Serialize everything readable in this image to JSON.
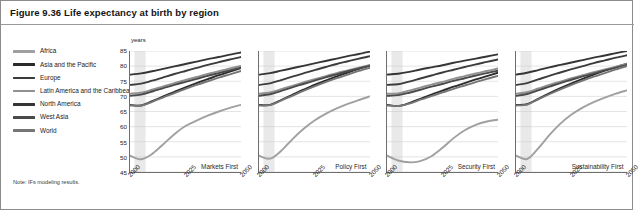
{
  "figure": {
    "title": "Figure 9.36 Life expectancy at birth by region",
    "note": "Note: IFs modeling results."
  },
  "legend": {
    "items": [
      {
        "label": "Africa",
        "color": "#a0a0a0"
      },
      {
        "label": "Asia and the Pacific",
        "color": "#2b2b2b"
      },
      {
        "label": "Europe",
        "color": "#3c3c3c"
      },
      {
        "label": "Latin America and the Caribbean",
        "color": "#909090"
      },
      {
        "label": "North America",
        "color": "#353535"
      },
      {
        "label": "West Asia",
        "color": "#4a4a4a"
      },
      {
        "label": "World",
        "color": "#767676"
      }
    ]
  },
  "axes": {
    "units": "years",
    "ylabels": [
      "85",
      "80",
      "75",
      "70",
      "65",
      "60",
      "55",
      "50",
      "45"
    ],
    "xlabels": [
      "2000",
      "2025",
      "2050"
    ]
  },
  "chart_data": {
    "type": "line",
    "title": "Life expectancy at birth by region",
    "xlabel": "",
    "ylabel": "years",
    "ylim": [
      45,
      85
    ],
    "xlim": [
      2000,
      2050
    ],
    "grid": true,
    "legend_position": "left",
    "x": [
      2000,
      2005,
      2010,
      2015,
      2020,
      2025,
      2030,
      2035,
      2040,
      2045,
      2050
    ],
    "panels": [
      {
        "name": "Markets First",
        "series": [
          {
            "name": "Africa",
            "color": "#a0a0a0",
            "values": [
              50.4,
              49.2,
              51.0,
              54.2,
              57.5,
              60.2,
              62.0,
              63.6,
              65.0,
              66.2,
              67.2
            ]
          },
          {
            "name": "Asia and the Pacific",
            "color": "#2b2b2b",
            "values": [
              67.2,
              67.0,
              68.4,
              70.0,
              71.5,
              73.0,
              74.4,
              75.7,
              77.0,
              78.2,
              79.4
            ]
          },
          {
            "name": "Europe",
            "color": "#3c3c3c",
            "values": [
              73.8,
              74.2,
              75.2,
              76.3,
              77.4,
              78.4,
              79.4,
              80.4,
              81.3,
              82.2,
              83.0
            ]
          },
          {
            "name": "Latin America and the Caribbean",
            "color": "#909090",
            "values": [
              70.9,
              71.2,
              72.2,
              73.3,
              74.4,
              75.4,
              76.4,
              77.4,
              78.3,
              79.2,
              80.1
            ]
          },
          {
            "name": "North America",
            "color": "#353535",
            "values": [
              77.2,
              77.6,
              78.3,
              79.1,
              79.9,
              80.7,
              81.5,
              82.3,
              83.0,
              83.8,
              84.5
            ]
          },
          {
            "name": "West Asia",
            "color": "#4a4a4a",
            "values": [
              70.2,
              70.6,
              71.6,
              72.7,
              73.8,
              74.8,
              75.8,
              76.8,
              77.7,
              78.6,
              79.5
            ]
          },
          {
            "name": "World",
            "color": "#767676",
            "values": [
              67.0,
              67.0,
              68.2,
              69.7,
              71.1,
              72.5,
              73.8,
              75.0,
              76.2,
              77.3,
              78.4
            ]
          }
        ]
      },
      {
        "name": "Policy First",
        "series": [
          {
            "name": "Africa",
            "color": "#a0a0a0",
            "values": [
              50.4,
              49.4,
              52.0,
              55.8,
              59.2,
              62.0,
              64.2,
              66.0,
              67.5,
              68.8,
              70.0
            ]
          },
          {
            "name": "Asia and the Pacific",
            "color": "#2b2b2b",
            "values": [
              67.2,
              67.2,
              68.8,
              70.5,
              72.2,
              73.8,
              75.2,
              76.6,
              77.9,
              79.1,
              80.2
            ]
          },
          {
            "name": "Europe",
            "color": "#3c3c3c",
            "values": [
              73.8,
              74.3,
              75.4,
              76.5,
              77.6,
              78.7,
              79.7,
              80.7,
              81.6,
              82.5,
              83.3
            ]
          },
          {
            "name": "Latin America and the Caribbean",
            "color": "#909090",
            "values": [
              70.9,
              71.3,
              72.4,
              73.5,
              74.6,
              75.7,
              76.7,
              77.7,
              78.6,
              79.5,
              80.4
            ]
          },
          {
            "name": "North America",
            "color": "#353535",
            "values": [
              77.2,
              77.7,
              78.5,
              79.3,
              80.1,
              80.9,
              81.7,
              82.5,
              83.3,
              84.0,
              84.8
            ]
          },
          {
            "name": "West Asia",
            "color": "#4a4a4a",
            "values": [
              70.2,
              70.7,
              71.8,
              73.0,
              74.1,
              75.2,
              76.3,
              77.3,
              78.3,
              79.2,
              80.1
            ]
          },
          {
            "name": "World",
            "color": "#767676",
            "values": [
              67.0,
              67.1,
              68.6,
              70.2,
              71.8,
              73.3,
              74.7,
              76.0,
              77.2,
              78.4,
              79.5
            ]
          }
        ]
      },
      {
        "name": "Security First",
        "series": [
          {
            "name": "Africa",
            "color": "#a0a0a0",
            "values": [
              50.4,
              48.8,
              48.2,
              48.6,
              50.2,
              53.0,
              56.2,
              58.8,
              60.6,
              61.7,
              62.3
            ]
          },
          {
            "name": "Asia and the Pacific",
            "color": "#2b2b2b",
            "values": [
              67.2,
              66.8,
              67.8,
              69.2,
              70.6,
              71.9,
              73.2,
              74.4,
              75.6,
              76.7,
              77.8
            ]
          },
          {
            "name": "Europe",
            "color": "#3c3c3c",
            "values": [
              73.8,
              74.0,
              74.9,
              75.9,
              76.9,
              77.9,
              78.8,
              79.7,
              80.6,
              81.4,
              82.2
            ]
          },
          {
            "name": "Latin America and the Caribbean",
            "color": "#909090",
            "values": [
              70.9,
              71.0,
              71.9,
              72.9,
              73.9,
              74.8,
              75.8,
              76.7,
              77.6,
              78.4,
              79.2
            ]
          },
          {
            "name": "North America",
            "color": "#353535",
            "values": [
              77.2,
              77.5,
              78.1,
              78.9,
              79.6,
              80.3,
              81.1,
              81.8,
              82.5,
              83.2,
              83.9
            ]
          },
          {
            "name": "West Asia",
            "color": "#4a4a4a",
            "values": [
              70.2,
              70.4,
              71.2,
              72.2,
              73.2,
              74.1,
              75.1,
              76.0,
              76.9,
              77.7,
              78.5
            ]
          },
          {
            "name": "World",
            "color": "#767676",
            "values": [
              67.0,
              66.8,
              67.6,
              68.9,
              70.1,
              71.3,
              72.5,
              73.6,
              74.7,
              75.8,
              76.8
            ]
          }
        ]
      },
      {
        "name": "Sustainability First",
        "series": [
          {
            "name": "Africa",
            "color": "#a0a0a0",
            "values": [
              50.4,
              49.3,
              52.8,
              57.2,
              61.0,
              64.0,
              66.3,
              68.1,
              69.6,
              70.9,
              72.0
            ]
          },
          {
            "name": "Asia and the Pacific",
            "color": "#2b2b2b",
            "values": [
              67.2,
              67.4,
              69.2,
              71.0,
              72.7,
              74.3,
              75.8,
              77.2,
              78.5,
              79.7,
              80.8
            ]
          },
          {
            "name": "Europe",
            "color": "#3c3c3c",
            "values": [
              73.8,
              74.4,
              75.6,
              76.8,
              77.9,
              79.0,
              80.0,
              81.0,
              81.9,
              82.8,
              83.6
            ]
          },
          {
            "name": "Latin America and the Caribbean",
            "color": "#909090",
            "values": [
              70.9,
              71.4,
              72.6,
              73.8,
              74.9,
              76.0,
              77.0,
              78.0,
              78.9,
              79.8,
              80.7
            ]
          },
          {
            "name": "North America",
            "color": "#353535",
            "values": [
              77.2,
              77.8,
              78.7,
              79.6,
              80.4,
              81.2,
              82.0,
              82.8,
              83.5,
              84.3,
              85.0
            ]
          },
          {
            "name": "West Asia",
            "color": "#4a4a4a",
            "values": [
              70.2,
              70.8,
              72.0,
              73.2,
              74.4,
              75.5,
              76.6,
              77.6,
              78.6,
              79.5,
              80.4
            ]
          },
          {
            "name": "World",
            "color": "#767676",
            "values": [
              67.0,
              67.3,
              69.0,
              70.7,
              72.3,
              73.8,
              75.2,
              76.5,
              77.7,
              78.9,
              80.0
            ]
          }
        ]
      }
    ]
  }
}
